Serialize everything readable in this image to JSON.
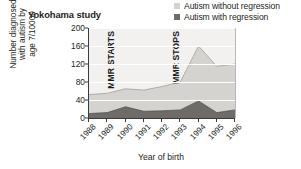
{
  "chart_data": {
    "type": "area",
    "stacked": true,
    "title": "Yokohama study",
    "xlabel": "Year of birth",
    "ylabel": "Number diagnosed\nwith autism by\nage 7/10000",
    "categories": [
      "1988",
      "1989",
      "1990",
      "1991",
      "1992",
      "1993",
      "1994",
      "1995",
      "1996"
    ],
    "ylim": [
      0,
      200
    ],
    "yticks": [
      0,
      40,
      80,
      120,
      160,
      200
    ],
    "grid": true,
    "legend_position": "top-right",
    "series": [
      {
        "name": "Autism with regression",
        "color": "#6e6b68",
        "values": [
          10,
          12,
          25,
          15,
          16,
          18,
          38,
          12,
          18
        ]
      },
      {
        "name": "Autism without regression",
        "color": "#d5d3d0",
        "values": [
          42,
          43,
          40,
          47,
          54,
          62,
          122,
          103,
          102
        ]
      }
    ],
    "totals": [
      52,
      55,
      65,
      62,
      70,
      80,
      160,
      115,
      120
    ],
    "annotations": [
      {
        "text": "MMR STARTS",
        "at_year": "1989",
        "orientation": "vertical"
      },
      {
        "text": "MMR STOPS",
        "at_year": "1993",
        "orientation": "vertical"
      }
    ]
  },
  "legend": {
    "items": [
      {
        "label": "Autism without regression",
        "swatch": "#d5d3d0"
      },
      {
        "label": "Autism with regression",
        "swatch": "#6e6b68"
      }
    ]
  },
  "colors": {
    "plot_background": "#f2f1f0",
    "axis": "#3a3a3a",
    "gridline": "#ffffff",
    "text": "#231f20"
  }
}
